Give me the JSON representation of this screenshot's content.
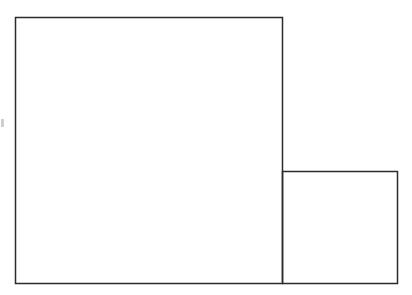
{
  "diagram": {
    "colors": {
      "background": "#ffffff",
      "stroke": "#2b2b2b",
      "edge_mark": "#cfcfcf"
    },
    "shapes": [
      {
        "id": "large-square",
        "kind": "square"
      },
      {
        "id": "small-rectangle",
        "kind": "rectangle"
      }
    ],
    "labels": []
  }
}
